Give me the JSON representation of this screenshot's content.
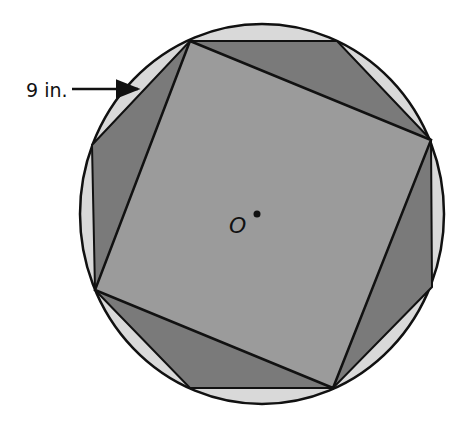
{
  "diagram": {
    "type": "inscribed-polygons",
    "colors": {
      "background": "#ffffff",
      "circle_fill": "#d9d9d9",
      "octagon_fill": "#7a7a7a",
      "square_fill": "#9b9b9b",
      "stroke": "#111111"
    },
    "circle": {
      "cx": 262,
      "cy": 214,
      "rx": 182,
      "ry": 190
    },
    "octagon_points": "190,41 337,41 431,140 432,287 333,388 190,388 95,290 92,145",
    "square_points": "190,41 431,140 333,388 95,290",
    "center_dot": {
      "cx": 257,
      "cy": 214,
      "r": 3.5
    },
    "labels": {
      "center": "O",
      "radius_label": "9 in."
    },
    "arrow": {
      "x1": 72,
      "y1": 89,
      "x2": 138,
      "y2": 89
    }
  }
}
